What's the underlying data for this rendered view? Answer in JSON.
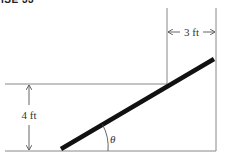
{
  "header": {
    "label": "ISE 33"
  },
  "diagram": {
    "width_label": "3 ft",
    "height_label": "4 ft",
    "angle_label": "θ",
    "colors": {
      "line": "#777777",
      "rod": "#111111",
      "text": "#333333"
    }
  }
}
